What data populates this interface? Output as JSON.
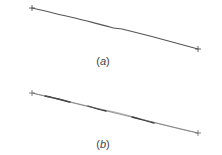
{
  "figure": {
    "panels": [
      {
        "id": "a",
        "caption_open": "(",
        "caption_letter": "a",
        "caption_close": ")",
        "start_point": [
          32,
          8
        ],
        "end_point": [
          198,
          49
        ],
        "line_color": "#555555",
        "description": "single slightly wavy line between two cross-marked endpoints"
      },
      {
        "id": "b",
        "caption_open": "(",
        "caption_letter": "b",
        "caption_close": ")",
        "start_point": [
          32,
          93
        ],
        "end_point": [
          198,
          133
        ],
        "straight_line_color": "#9a9a9a",
        "wavy_line_color": "#333333",
        "description": "straight reference line with darker wavy stroke overlaid"
      }
    ],
    "endpoint_marker": "cross",
    "background_color": "#ffffff"
  }
}
